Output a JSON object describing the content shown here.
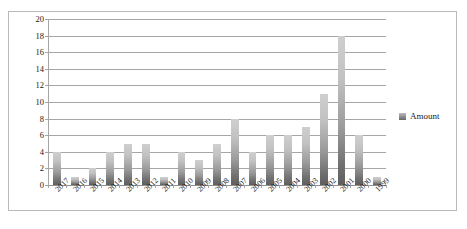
{
  "chart_data": {
    "type": "bar",
    "title": "",
    "xlabel": "",
    "ylabel": "",
    "ylim": [
      0,
      20
    ],
    "ytick_step": 2,
    "yticks": [
      "0",
      "2",
      "4",
      "6",
      "8",
      "10",
      "12",
      "14",
      "16",
      "18",
      "20"
    ],
    "grid": true,
    "legend_position": "right",
    "categories": [
      "2017",
      "2016",
      "2015",
      "2014",
      "2013",
      "2012",
      "2011",
      "2010",
      "2009",
      "2008",
      "2007",
      "2006",
      "2005",
      "2004",
      "2003",
      "2002",
      "2001",
      "2000",
      "1999"
    ],
    "series": [
      {
        "name": "Amount",
        "values": [
          4,
          1,
          2,
          4,
          5,
          5,
          1,
          4,
          3,
          5,
          8,
          4,
          6,
          6,
          7,
          11,
          18,
          6,
          1
        ]
      }
    ]
  },
  "legend": {
    "items": [
      {
        "label": "Amount",
        "color": "#8a8a8a"
      }
    ]
  },
  "colors": {
    "bar_top": "#cfcfcf",
    "bar_bottom": "#5e5e5e",
    "gridline": "#a6a6a6",
    "frame_border": "#b9b9b9",
    "text": "#1a1a1a",
    "background": "#ffffff"
  }
}
